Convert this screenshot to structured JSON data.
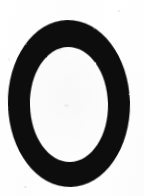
{
  "image": {
    "kind": "scanned-character-image",
    "subject_label": "0",
    "subject_description": "large bold black oval character on white paper",
    "width_px": 144,
    "height_px": 196
  },
  "colors": {
    "background": "#ffffff",
    "paper_tint": "#fdfdfd",
    "ink": "#0d0c0c",
    "ink_edge": "#1a1818",
    "speckle": "#e9e9e9"
  },
  "glyph": {
    "name": "zero-glyph",
    "character": "0",
    "outer_ellipse": {
      "center_x": 69,
      "center_y": 103.5,
      "radius_x": 61,
      "radius_y": 83.5
    },
    "inner_counter_ellipse": {
      "center_x": 69,
      "center_y": 104.5,
      "radius_x": 39,
      "radius_y": 57.5
    },
    "stroke_widths": {
      "left_px": 24,
      "right_px": 22,
      "top_px": 27,
      "bottom_px": 26
    },
    "bounds": {
      "left_px": 8,
      "right_px": 130,
      "top_px": 20,
      "bottom_px": 187
    },
    "rotation_deg": -1.2
  },
  "speckles": [
    {
      "name": "speckle-bottom-left"
    },
    {
      "name": "speckle-top-right"
    },
    {
      "name": "speckle-center"
    },
    {
      "name": "speckle-left-edge"
    }
  ]
}
